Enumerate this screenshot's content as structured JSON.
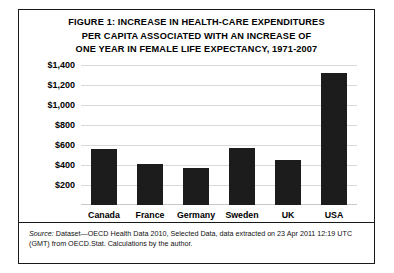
{
  "figure": {
    "title_lines": [
      "FIGURE 1: INCREASE IN HEALTH-CARE EXPENDITURES",
      "PER CAPITA ASSOCIATED WITH AN INCREASE OF",
      "ONE YEAR IN FEMALE LIFE EXPECTANCY, 1971-2007"
    ],
    "source_label": "Source:",
    "source_text": " Dataset—OECD Health Data 2010, Selected Data, data extracted on 23 Apr 2011 12:19 UTC (GMT) from OECD.Stat. Calculations by the author.",
    "bar_color": "#1c1c1c",
    "frame_color": "#1a1a1a",
    "gridline_color": "#d9d9d9"
  },
  "chart_data": {
    "type": "bar",
    "title": "FIGURE 1: INCREASE IN HEALTH-CARE EXPENDITURES PER CAPITA ASSOCIATED WITH AN INCREASE OF ONE YEAR IN FEMALE LIFE EXPECTANCY, 1971-2007",
    "xlabel": "",
    "ylabel": "",
    "categories": [
      "Canada",
      "France",
      "Germany",
      "Sweden",
      "UK",
      "USA"
    ],
    "values": [
      560,
      415,
      375,
      570,
      455,
      1320
    ],
    "ylim": [
      0,
      1400
    ],
    "ytick_values": [
      1400,
      1200,
      1000,
      800,
      600,
      400,
      200
    ],
    "ytick_labels": [
      "$1,400",
      "$1,200",
      "$1,000",
      "$800",
      "$600",
      "$400",
      "$200"
    ],
    "grid": true,
    "legend": "none",
    "series": [
      {
        "name": "Increase in health-care expenditures per capita",
        "values": [
          560,
          415,
          375,
          570,
          455,
          1320
        ]
      }
    ]
  }
}
